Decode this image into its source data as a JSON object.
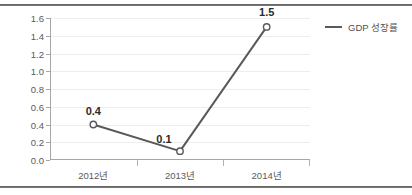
{
  "chart_data": {
    "type": "line",
    "title": "",
    "xlabel": "",
    "ylabel": "",
    "categories": [
      "2012년",
      "2013년",
      "2014년"
    ],
    "series": [
      {
        "name": "GDP 성장률",
        "values": [
          0.4,
          0.1,
          1.5
        ],
        "color": "#595959",
        "marker": "open-circle",
        "data_labels": [
          "0.4",
          "0.1",
          "1.5"
        ]
      }
    ],
    "ylim": [
      0.0,
      1.6
    ],
    "ytick_labels": [
      "0.0",
      "0.2",
      "0.4",
      "0.6",
      "0.8",
      "1.0",
      "1.2",
      "1.4",
      "1.6"
    ],
    "ytick_values": [
      0.0,
      0.2,
      0.4,
      0.6,
      0.8,
      1.0,
      1.2,
      1.4,
      1.6
    ],
    "grid": true,
    "grid_axis": "y",
    "legend_position": "right"
  },
  "legend": {
    "entries": [
      {
        "label": "GDP 성장률",
        "color": "#595959"
      }
    ]
  },
  "colors": {
    "series_line": "#595959",
    "gridline": "#ededed",
    "axis": "#a6a6a6",
    "tick_text": "#5a5a5a",
    "label_text": "#2b2b2b",
    "frame_rule": "#4a4a4a",
    "background": "#ffffff"
  }
}
